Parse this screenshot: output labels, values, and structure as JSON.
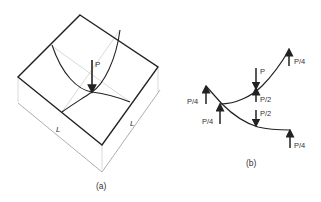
{
  "figure_a": {
    "caption": "(a)",
    "load_label": "P",
    "dim_left": "L",
    "dim_right": "L"
  },
  "figure_b": {
    "caption": "(b)",
    "labels": {
      "top_right": "P/4",
      "applied": "P",
      "mid_upper": "P/2",
      "mid_lower": "P/2",
      "left_upper": "P/4",
      "left_lower": "P/4",
      "bottom_right": "P/4"
    }
  },
  "colors": {
    "stroke": "#222222",
    "hidden": "#c8c8c8",
    "text": "#333333"
  }
}
